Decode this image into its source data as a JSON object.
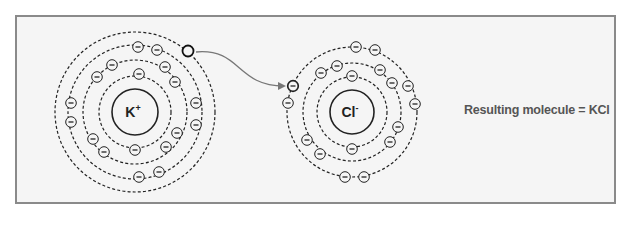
{
  "diagram": {
    "type": "ionic-bond-electron-transfer",
    "colors": {
      "background": "#f5f5f5",
      "frame": "#8a8a8a",
      "stroke": "#222222",
      "arrow": "#777777",
      "text": "#555555"
    },
    "atoms": [
      {
        "id": "potassium",
        "label": "K",
        "charge": "+",
        "center": [
          135,
          112
        ],
        "nucleus_radius": 23,
        "shells": [
          {
            "radius": 36,
            "electrons": [
              [
                139,
                74
              ],
              [
                135,
                150
              ]
            ]
          },
          {
            "radius": 52,
            "electrons": [
              [
                112,
                65
              ],
              [
                97,
                77
              ],
              [
                165,
                67
              ],
              [
                175,
                82
              ],
              [
                177,
                133
              ],
              [
                166,
                147
              ],
              [
                93,
                139
              ],
              [
                104,
                152
              ]
            ]
          },
          {
            "radius": 67,
            "electrons": [
              [
                138,
                47
              ],
              [
                157,
                50
              ],
              [
                196,
                103
              ],
              [
                196,
                125
              ],
              [
                139,
                177
              ],
              [
                159,
                172
              ],
              [
                71,
                103
              ],
              [
                71,
                122
              ]
            ]
          },
          {
            "radius": 80,
            "electrons": [],
            "vacated_electron": [
              188,
              51
            ]
          }
        ]
      },
      {
        "id": "chlorine",
        "label": "Cl",
        "charge": "-",
        "center": [
          352,
          112
        ],
        "nucleus_radius": 22,
        "shells": [
          {
            "radius": 35,
            "electrons": [
              [
                352,
                76
              ],
              [
                352,
                149
              ]
            ]
          },
          {
            "radius": 49,
            "electrons": [
              [
                337,
                66
              ],
              [
                321,
                73
              ],
              [
                380,
                70
              ],
              [
                392,
                83
              ],
              [
                398,
                127
              ],
              [
                390,
                142
              ],
              [
                307,
                140
              ],
              [
                320,
                154
              ]
            ]
          },
          {
            "radius": 65,
            "electrons": [
              [
                356,
                47
              ],
              [
                375,
                50
              ],
              [
                408,
                86
              ],
              [
                415,
                104
              ],
              [
                345,
                177
              ],
              [
                364,
                177
              ],
              [
                288,
                103
              ]
            ],
            "received_electron": [
              293,
              86
            ]
          }
        ]
      }
    ],
    "transfer_arrow": {
      "from": [
        196,
        52
      ],
      "to": [
        284,
        86
      ]
    },
    "caption": "Resulting molecule = KCl"
  }
}
